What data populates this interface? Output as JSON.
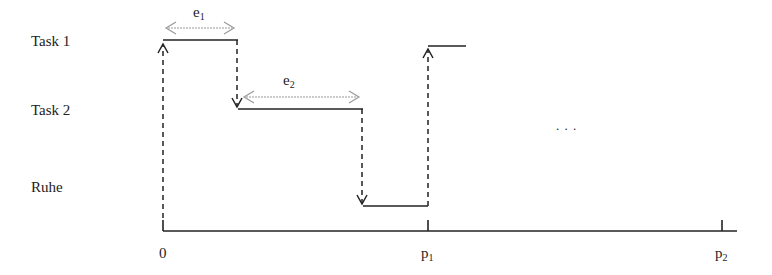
{
  "diagram": {
    "type": "task-schedule-timeline",
    "rows": [
      {
        "label": "Task 1"
      },
      {
        "label": "Task 2"
      },
      {
        "label": "Ruhe"
      }
    ],
    "durations": [
      {
        "base": "e",
        "sub": "1"
      },
      {
        "base": "e",
        "sub": "2"
      }
    ],
    "axis": {
      "ticks": [
        {
          "base": "0",
          "sub": ""
        },
        {
          "base": "p",
          "sub": "1"
        },
        {
          "base": "p",
          "sub": "2"
        }
      ]
    },
    "ellipsis": ". . .",
    "colors": {
      "line": "#222222",
      "duration_arrow": "#999999"
    }
  }
}
